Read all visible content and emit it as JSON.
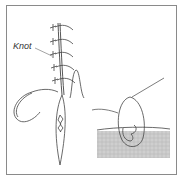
{
  "figure": {
    "labels": {
      "knot": "Knot"
    },
    "colors": {
      "stroke": "#444444",
      "frame": "#8a8a8a",
      "tissue": "#c8c8c8"
    },
    "elements": [
      "suture-line-with-knots",
      "curved-needle",
      "wound-incision",
      "skin-fold",
      "cross-section-suture-through-tissue"
    ]
  }
}
